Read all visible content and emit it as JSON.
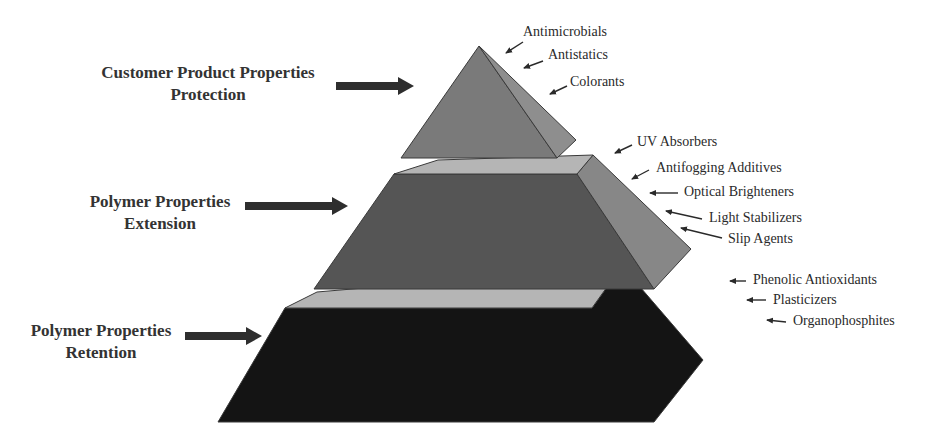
{
  "diagram": {
    "type": "layered-pyramid",
    "colors": {
      "top_front": "#7a7a7a",
      "top_side": "#8e8e8e",
      "middle_front": "#555555",
      "middle_side": "#878787",
      "plate": "#b5b5b5",
      "bottom_front": "#141414",
      "arrow": "#2e2e2e",
      "edge": "#3a3a3a"
    },
    "tiers": [
      {
        "id": "top",
        "label_lines": [
          "Customer Product Properties",
          "Protection"
        ],
        "label_pos": {
          "x": 86,
          "y": 62,
          "w": 244
        },
        "arrow": {
          "x1": 336,
          "y1": 86,
          "x2": 414,
          "y2": 86
        },
        "additives": [
          "Antimicrobials",
          "Antistatics",
          "Colorants"
        ]
      },
      {
        "id": "middle",
        "label_lines": [
          "Polymer Properties",
          "Extension"
        ],
        "label_pos": {
          "x": 80,
          "y": 191,
          "w": 160
        },
        "arrow": {
          "x1": 245,
          "y1": 206,
          "x2": 348,
          "y2": 206
        },
        "additives": [
          "UV Absorbers",
          "Antifogging Additives",
          "Optical Brighteners",
          "Light Stabilizers",
          "Slip Agents"
        ]
      },
      {
        "id": "bottom",
        "label_lines": [
          "Polymer Properties",
          "Retention"
        ],
        "label_pos": {
          "x": 20,
          "y": 320,
          "w": 162
        },
        "arrow": {
          "x1": 185,
          "y1": 336,
          "x2": 262,
          "y2": 336
        },
        "additives": [
          "Phenolic Antioxidants",
          "Plasticizers",
          "Organophosphites"
        ]
      }
    ],
    "additive_labels": [
      {
        "text": "Antimicrobials",
        "x": 523,
        "y": 24,
        "ax1": 523,
        "ay1": 42,
        "ax2": 506,
        "ay2": 53
      },
      {
        "text": "Antistatics",
        "x": 548,
        "y": 47,
        "ax1": 543,
        "ay1": 61,
        "ax2": 524,
        "ay2": 68
      },
      {
        "text": "Colorants",
        "x": 570,
        "y": 74,
        "ax1": 567,
        "ay1": 86,
        "ax2": 550,
        "ay2": 94
      },
      {
        "text": "UV Absorbers",
        "x": 637,
        "y": 134,
        "ax1": 632,
        "ay1": 145,
        "ax2": 615,
        "ay2": 153
      },
      {
        "text": "Antifogging Additives",
        "x": 656,
        "y": 160,
        "ax1": 649,
        "ay1": 170,
        "ax2": 632,
        "ay2": 179
      },
      {
        "text": "Optical Brighteners",
        "x": 684,
        "y": 184,
        "ax1": 678,
        "ay1": 193,
        "ax2": 650,
        "ay2": 193
      },
      {
        "text": "Light Stabilizers",
        "x": 709,
        "y": 210,
        "ax1": 702,
        "ay1": 219,
        "ax2": 666,
        "ay2": 211
      },
      {
        "text": "Slip Agents",
        "x": 728,
        "y": 231,
        "ax1": 722,
        "ay1": 238,
        "ax2": 681,
        "ay2": 228
      },
      {
        "text": "Phenolic Antioxidants",
        "x": 753,
        "y": 272,
        "ax1": 746,
        "ay1": 281,
        "ax2": 730,
        "ay2": 281
      },
      {
        "text": "Plasticizers",
        "x": 773,
        "y": 292,
        "ax1": 766,
        "ay1": 300,
        "ax2": 747,
        "ay2": 300
      },
      {
        "text": "Organophosphites",
        "x": 793,
        "y": 313,
        "ax1": 786,
        "ay1": 322,
        "ax2": 767,
        "ay2": 320
      }
    ],
    "shapes": {
      "top_front": "479,46 401,158 557,158",
      "top_side": "479,46 557,158 576,140",
      "middle_plate": "394,174 438,160 593,155 577,174",
      "middle_front": "394,174 577,174 654,289 314,289",
      "middle_side": "577,174 593,155 691,249 654,289",
      "bottom_plate": "285,308 317,292 622,266 592,308",
      "bottom_front": "285,308 592,308 622,266 703,360 654,422 218,422"
    }
  }
}
